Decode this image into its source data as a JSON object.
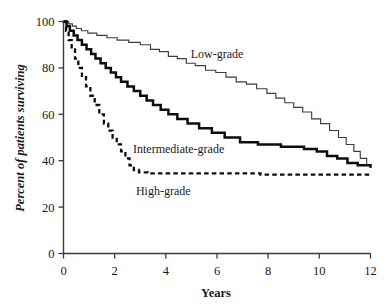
{
  "chart_data": {
    "type": "line",
    "title": "",
    "subtitle": "",
    "xlabel": "Years",
    "ylabel": "Percent of patients surviving",
    "xlim": [
      0,
      12
    ],
    "ylim": [
      0,
      100
    ],
    "xticks": [
      0,
      2,
      4,
      6,
      8,
      10,
      12
    ],
    "xtick_labels": [
      "0",
      "2",
      "4",
      "6",
      "8",
      "10",
      "12"
    ],
    "yticks": [
      0,
      20,
      40,
      60,
      80,
      100
    ],
    "ytick_labels": [
      "0",
      "20",
      "40",
      "60",
      "80",
      "100"
    ],
    "grid": false,
    "legend_position": "inline-annotations",
    "curve_style": "kaplan-meier-step",
    "series": [
      {
        "name": "Low-grade",
        "style": "thin-solid",
        "color": "#3d3d3d",
        "annotation": "Low-grade",
        "annotation_x": 6.0,
        "annotation_y": 86,
        "points": [
          [
            0.0,
            100
          ],
          [
            0.2,
            99
          ],
          [
            0.35,
            98
          ],
          [
            0.5,
            97
          ],
          [
            0.7,
            96
          ],
          [
            0.95,
            95
          ],
          [
            1.3,
            94
          ],
          [
            1.7,
            93
          ],
          [
            2.1,
            92
          ],
          [
            2.55,
            91
          ],
          [
            3.0,
            90
          ],
          [
            3.4,
            88
          ],
          [
            3.75,
            87
          ],
          [
            4.1,
            85
          ],
          [
            4.45,
            84
          ],
          [
            4.8,
            82
          ],
          [
            5.15,
            81
          ],
          [
            5.55,
            79
          ],
          [
            5.95,
            78
          ],
          [
            6.35,
            76
          ],
          [
            6.75,
            74
          ],
          [
            7.15,
            73
          ],
          [
            7.55,
            71
          ],
          [
            7.95,
            69
          ],
          [
            8.3,
            67
          ],
          [
            8.65,
            65
          ],
          [
            9.0,
            63
          ],
          [
            9.35,
            61
          ],
          [
            9.7,
            58
          ],
          [
            10.05,
            56
          ],
          [
            10.4,
            53
          ],
          [
            10.75,
            50
          ],
          [
            11.05,
            47
          ],
          [
            11.35,
            44
          ],
          [
            11.6,
            41
          ],
          [
            11.85,
            38
          ],
          [
            12.0,
            37
          ]
        ]
      },
      {
        "name": "Intermediate-grade",
        "style": "thick-solid",
        "color": "#0d0d0d",
        "annotation": "Intermediate-grade",
        "annotation_x": 4.5,
        "annotation_y": 45,
        "points": [
          [
            0.0,
            100
          ],
          [
            0.12,
            98
          ],
          [
            0.25,
            96
          ],
          [
            0.4,
            94
          ],
          [
            0.55,
            92
          ],
          [
            0.72,
            90
          ],
          [
            0.9,
            88
          ],
          [
            1.08,
            86
          ],
          [
            1.25,
            84
          ],
          [
            1.45,
            82
          ],
          [
            1.65,
            80
          ],
          [
            1.85,
            78
          ],
          [
            2.05,
            76
          ],
          [
            2.25,
            74
          ],
          [
            2.5,
            72
          ],
          [
            2.75,
            70
          ],
          [
            3.0,
            68
          ],
          [
            3.25,
            66
          ],
          [
            3.5,
            64
          ],
          [
            3.8,
            62
          ],
          [
            4.1,
            60
          ],
          [
            4.45,
            58
          ],
          [
            4.85,
            56
          ],
          [
            5.3,
            54
          ],
          [
            5.8,
            52
          ],
          [
            6.3,
            50
          ],
          [
            6.9,
            48
          ],
          [
            7.6,
            47
          ],
          [
            8.5,
            46
          ],
          [
            9.4,
            45
          ],
          [
            9.9,
            44
          ],
          [
            10.3,
            42
          ],
          [
            10.7,
            41
          ],
          [
            11.1,
            39
          ],
          [
            11.5,
            38
          ],
          [
            12.0,
            37
          ]
        ]
      },
      {
        "name": "High-grade",
        "style": "dashed",
        "color": "#0d0d0d",
        "annotation": "High-grade",
        "annotation_x": 3.9,
        "annotation_y": 27,
        "points": [
          [
            0.0,
            100
          ],
          [
            0.1,
            96
          ],
          [
            0.2,
            92
          ],
          [
            0.32,
            88
          ],
          [
            0.45,
            84
          ],
          [
            0.58,
            80
          ],
          [
            0.72,
            76
          ],
          [
            0.88,
            72
          ],
          [
            1.05,
            68
          ],
          [
            1.22,
            64
          ],
          [
            1.4,
            60
          ],
          [
            1.58,
            56
          ],
          [
            1.75,
            53
          ],
          [
            1.92,
            50
          ],
          [
            2.08,
            47
          ],
          [
            2.25,
            44
          ],
          [
            2.42,
            41
          ],
          [
            2.58,
            38
          ],
          [
            2.75,
            36
          ],
          [
            2.95,
            35
          ],
          [
            3.3,
            34.5
          ],
          [
            4.0,
            34.5
          ],
          [
            5.0,
            34.5
          ],
          [
            6.0,
            34.5
          ],
          [
            7.0,
            34.5
          ],
          [
            7.6,
            34.5
          ],
          [
            7.7,
            34
          ],
          [
            8.5,
            34
          ],
          [
            9.5,
            34
          ],
          [
            10.5,
            34
          ],
          [
            11.5,
            34
          ],
          [
            12.0,
            34
          ]
        ]
      }
    ]
  },
  "axes": {
    "y_title": "Percent of patients surviving",
    "x_title": "Years"
  }
}
